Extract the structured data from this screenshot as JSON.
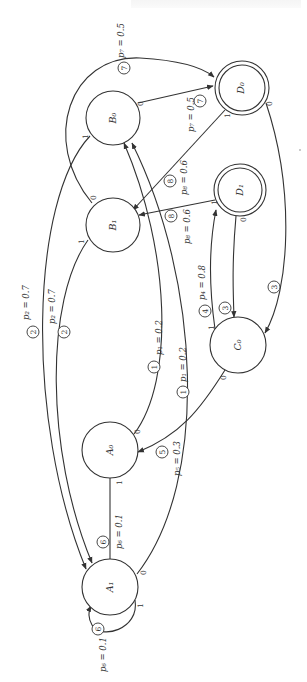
{
  "diagram": {
    "title": "",
    "orientation": "rotated-90",
    "nodes": [
      {
        "id": "D0",
        "label": "D₀",
        "cx": 242,
        "cy": 88,
        "r": 27,
        "accepting": true
      },
      {
        "id": "B0",
        "label": "B₀",
        "cx": 113,
        "cy": 118,
        "r": 27,
        "accepting": false
      },
      {
        "id": "D1",
        "label": "D₁",
        "cx": 240,
        "cy": 190,
        "r": 26,
        "accepting": true
      },
      {
        "id": "B1",
        "label": "B₁",
        "cx": 113,
        "cy": 225,
        "r": 27,
        "accepting": false
      },
      {
        "id": "C0",
        "label": "C₀",
        "cx": 238,
        "cy": 345,
        "r": 28,
        "accepting": false
      },
      {
        "id": "A0",
        "label": "A₀",
        "cx": 110,
        "cy": 450,
        "r": 28,
        "accepting": false
      },
      {
        "id": "A1",
        "label": "A₁",
        "cx": 110,
        "cy": 587,
        "r": 28,
        "accepting": false
      }
    ],
    "edges": [
      {
        "from": "B0",
        "to": "D0",
        "bit": "0",
        "tag": "7",
        "prob": "p₇ = 0.5"
      },
      {
        "from": "B1",
        "to": "D0",
        "bit": "0",
        "tag": "7",
        "prob": "p₇ = 0.5"
      },
      {
        "from": "D0",
        "to": "B1",
        "bit": "1",
        "tag": "8",
        "prob": "p₈ = 0.6"
      },
      {
        "from": "D1",
        "to": "B1",
        "bit": "1",
        "tag": "8",
        "prob": "p₈ = 0.6"
      },
      {
        "from": "B0",
        "to": "A1",
        "bit": "1",
        "tag": "2",
        "prob": "p₂ = 0.7"
      },
      {
        "from": "B1",
        "to": "A1",
        "bit": "1",
        "tag": "2",
        "prob": "p₂ = 0.7"
      },
      {
        "from": "A0",
        "to": "B0",
        "bit": "0",
        "tag": "1",
        "prob": "p₁ = 0.2"
      },
      {
        "from": "A1",
        "to": "B0",
        "bit": "0",
        "tag": "1",
        "prob": "p₁ = 0.2"
      },
      {
        "from": "D0",
        "to": "C0",
        "bit": "0",
        "tag": "3",
        "prob": ""
      },
      {
        "from": "D1",
        "to": "C0",
        "bit": "0",
        "tag": "3",
        "prob": ""
      },
      {
        "from": "C0",
        "to": "D1",
        "bit": "1",
        "tag": "4",
        "prob": "p₄ = 0.8"
      },
      {
        "from": "C0",
        "to": "A0",
        "bit": "0",
        "tag": "5",
        "prob": "p₅ = 0.3"
      },
      {
        "from": "A0",
        "to": "A1",
        "bit": "1",
        "tag": "6",
        "prob": "p₆ = 0.1"
      },
      {
        "from": "A1",
        "to": "A1",
        "bit": "1",
        "tag": "6",
        "prob": "p₆ = 0.1"
      }
    ]
  },
  "labels": {
    "p7a": "p₇ = 0.5",
    "p7b": "p₇ = 0.5",
    "p8a": "p₈ = 0.6",
    "p8b": "p₈ = 0.6",
    "p2a": "p₂ = 0.7",
    "p2b": "p₂ = 0.7",
    "p1a": "p₁ = 0.2",
    "p1b": "p₁ = 0.2",
    "p4": "p₄ = 0.8",
    "p5": "p₅ = 0.3",
    "p6a": "p₆ = 0.1",
    "p6b": "p₆ = 0.1",
    "t1": "1",
    "t2": "2",
    "t3": "3",
    "t4": "4",
    "t5": "5",
    "t6": "6",
    "t7": "7",
    "t8": "8",
    "zero": "0",
    "one": "1",
    "nD0": "D₀",
    "nB0": "B₀",
    "nD1": "D₁",
    "nB1": "B₁",
    "nC0": "C₀",
    "nA0": "A₀",
    "nA1": "A₁"
  }
}
